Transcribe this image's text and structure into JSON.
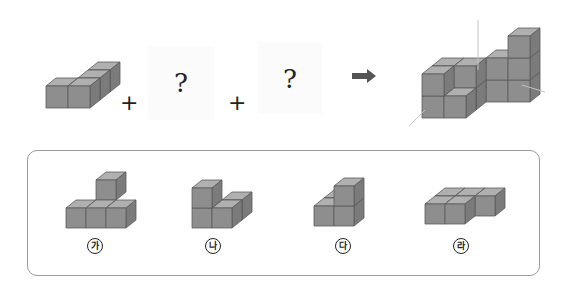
{
  "problem": {
    "operator_plus": "+",
    "unknown_mark": "?",
    "arrow_icon": "right-arrow-icon"
  },
  "colors": {
    "cube_top": "#b0b0b0",
    "cube_front": "#8e8e8e",
    "cube_side": "#7b7b7b",
    "cube_edge": "#5a5a5a",
    "panel_border": "#9a9a9a",
    "axis_line": "#bdbdbd"
  },
  "equation": {
    "given_piece": "4-cube piece",
    "unknown_1": "?",
    "unknown_2": "?",
    "result": "combined shape"
  },
  "options": [
    {
      "id": "ga",
      "label": "가"
    },
    {
      "id": "na",
      "label": "나"
    },
    {
      "id": "da",
      "label": "다"
    },
    {
      "id": "ra",
      "label": "라"
    }
  ]
}
